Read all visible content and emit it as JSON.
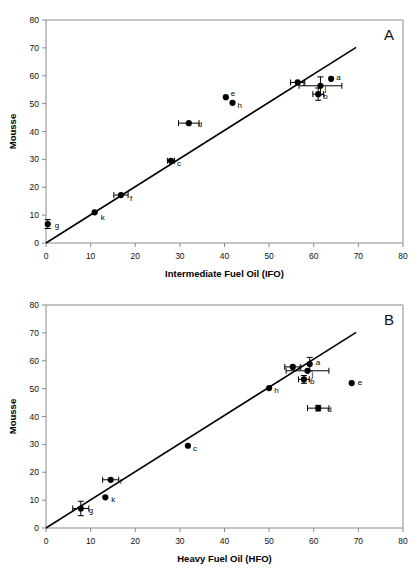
{
  "figure": {
    "background": "#ffffff",
    "marker_color": "#000000",
    "line_color": "#000000",
    "axis_color": "#8a8a8a"
  },
  "chart_data": [
    {
      "type": "scatter",
      "panel": "A",
      "panel_label": "A",
      "title": "",
      "xlabel": "Intermediate Fuel Oil (IFO)",
      "ylabel": "Mousse",
      "xlim": [
        0,
        80
      ],
      "ylim": [
        0,
        80
      ],
      "xticks": [
        0,
        10,
        20,
        30,
        40,
        50,
        60,
        70,
        80
      ],
      "yticks": [
        0,
        10,
        20,
        30,
        40,
        50,
        60,
        70,
        80
      ],
      "grid": false,
      "legend": "none",
      "fit_line": {
        "x0": 0,
        "y0": 0,
        "x1": 69.5,
        "y1": 70.2
      },
      "points": [
        {
          "label": "g",
          "x": 0.4,
          "y": 6.8,
          "xerr": 0,
          "yerr": 1.6,
          "label_dx": 7,
          "label_dy": 4
        },
        {
          "label": "k",
          "x": 10.9,
          "y": 11.0,
          "xerr": 0,
          "yerr": 0,
          "label_dx": 6,
          "label_dy": 8
        },
        {
          "label": "f",
          "x": 16.8,
          "y": 17.2,
          "xerr": 1.6,
          "yerr": 0,
          "label_dx": 9,
          "label_dy": 6
        },
        {
          "label": "c",
          "x": 28.0,
          "y": 29.5,
          "xerr": 0.8,
          "yerr": 0,
          "label_dx": 6,
          "label_dy": 5
        },
        {
          "label": "d",
          "x": 32.0,
          "y": 43.0,
          "xerr": 2.3,
          "yerr": 0,
          "label_dx": 9,
          "label_dy": 4
        },
        {
          "label": "e",
          "x": 40.3,
          "y": 52.3,
          "xerr": 0,
          "yerr": 0,
          "label_dx": 5,
          "label_dy": -1
        },
        {
          "label": "h",
          "x": 41.8,
          "y": 50.3,
          "xerr": 0,
          "yerr": 0,
          "label_dx": 5,
          "label_dy": 5
        },
        {
          "label": "i",
          "x": 56.4,
          "y": 57.6,
          "xerr": 1.6,
          "yerr": 0,
          "label_dx": 5,
          "label_dy": 4
        },
        {
          "label": "j",
          "x": 61.5,
          "y": 56.4,
          "xerr": 4.8,
          "yerr": 3.2,
          "label_dx": 4,
          "label_dy": 5
        },
        {
          "label": "b",
          "x": 61.0,
          "y": 53.4,
          "xerr": 1.2,
          "yerr": 2.2,
          "label_dx": 5,
          "label_dy": 5
        },
        {
          "label": "a",
          "x": 63.9,
          "y": 58.9,
          "xerr": 0,
          "yerr": 0,
          "label_dx": 5,
          "label_dy": 1
        }
      ]
    },
    {
      "type": "scatter",
      "panel": "B",
      "panel_label": "B",
      "title": "",
      "xlabel": "Heavy Fuel Oil (HFO)",
      "ylabel": "Mousse",
      "xlim": [
        0,
        80
      ],
      "ylim": [
        0,
        80
      ],
      "xticks": [
        0,
        10,
        20,
        30,
        40,
        50,
        60,
        70,
        80
      ],
      "yticks": [
        0,
        10,
        20,
        30,
        40,
        50,
        60,
        70,
        80
      ],
      "grid": false,
      "legend": "none",
      "fit_line": {
        "x0": 0,
        "y0": 0,
        "x1": 69.5,
        "y1": 70.2
      },
      "points": [
        {
          "label": "g",
          "x": 7.8,
          "y": 7.0,
          "xerr": 1.8,
          "yerr": 2.6,
          "label_dx": 8,
          "label_dy": 5
        },
        {
          "label": "k",
          "x": 13.3,
          "y": 11.0,
          "xerr": 0,
          "yerr": 0,
          "label_dx": 6,
          "label_dy": 5
        },
        {
          "label": "f",
          "x": 14.5,
          "y": 17.3,
          "xerr": 1.8,
          "yerr": 0,
          "label_dx": 9,
          "label_dy": 4
        },
        {
          "label": "c",
          "x": 31.8,
          "y": 29.5,
          "xerr": 0,
          "yerr": 0,
          "label_dx": 5,
          "label_dy": 5
        },
        {
          "label": "h",
          "x": 50.0,
          "y": 50.2,
          "xerr": 0,
          "yerr": 0,
          "label_dx": 5,
          "label_dy": 5
        },
        {
          "label": "i",
          "x": 55.3,
          "y": 57.8,
          "xerr": 1.8,
          "yerr": 0,
          "label_dx": 6,
          "label_dy": 3
        },
        {
          "label": "a",
          "x": 59.1,
          "y": 58.8,
          "xerr": 0,
          "yerr": 2.4,
          "label_dx": 6,
          "label_dy": 1
        },
        {
          "label": "j",
          "x": 58.6,
          "y": 56.4,
          "xerr": 4.8,
          "yerr": 0,
          "label_dx": 4,
          "label_dy": 6
        },
        {
          "label": "b",
          "x": 57.8,
          "y": 53.3,
          "xerr": 1.2,
          "yerr": 1.4,
          "label_dx": 6,
          "label_dy": 5
        },
        {
          "label": "e",
          "x": 68.5,
          "y": 52.0,
          "xerr": 0,
          "yerr": 0,
          "label_dx": 6,
          "label_dy": 2
        },
        {
          "label": "d",
          "x": 61.0,
          "y": 43.0,
          "xerr": 2.4,
          "yerr": 1.0,
          "label_dx": 9,
          "label_dy": 4
        }
      ]
    }
  ]
}
